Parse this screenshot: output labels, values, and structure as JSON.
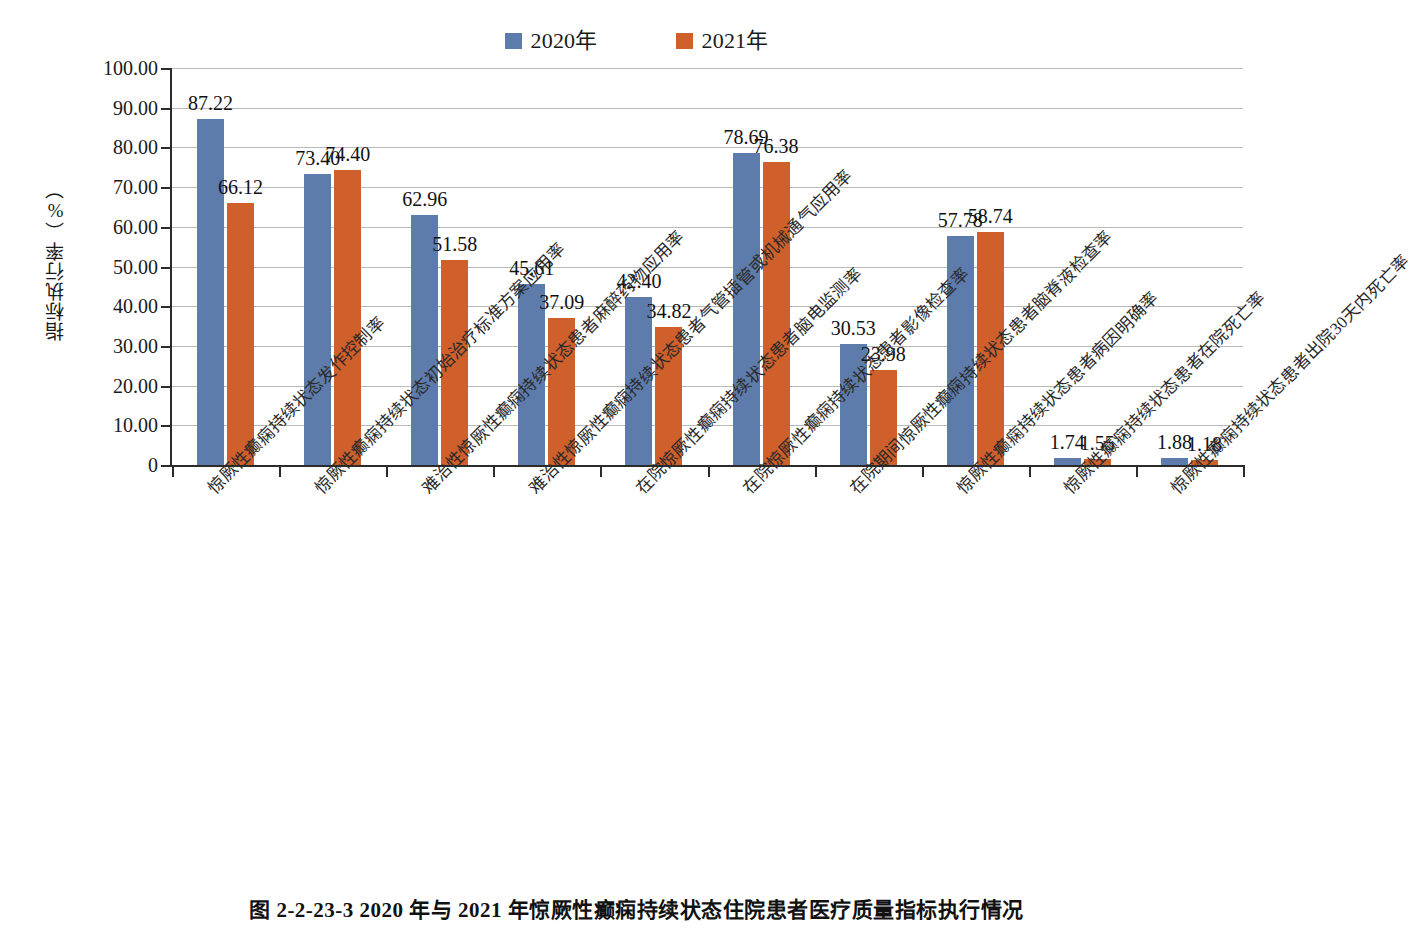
{
  "chart_data": {
    "type": "bar",
    "title": "",
    "xlabel": "",
    "ylabel": "指标执行率（%）",
    "ylim": [
      0,
      100
    ],
    "ytick_labels": [
      "100.00",
      "90.00",
      "80.00",
      "70.00",
      "60.00",
      "50.00",
      "40.00",
      "30.00",
      "20.00",
      "10.00",
      "0"
    ],
    "ytick_values": [
      100,
      90,
      80,
      70,
      60,
      50,
      40,
      30,
      20,
      10,
      0
    ],
    "grid": true,
    "legend_position": "top-center",
    "categories": [
      "惊厥性癫痫持续状态发作控制率",
      "惊厥性癫痫持续状态初始治疗标准方案应用率",
      "难治性惊厥性癫痫持续状态患者麻醉药物应用率",
      "难治性惊厥性癫痫持续状态患者气管插管或机械通气应用率",
      "在院惊厥性癫痫持续状态患者脑电监测率",
      "在院惊厥性癫痫持续状态患者影像检查率",
      "在院期间惊厥性癫痫持续状态患者脑脊液检查率",
      "惊厥性癫痫持续状态患者病因明确率",
      "惊厥性癫痫持续状态患者在院死亡率",
      "惊厥性癫痫持续状态患者出院30天内死亡率"
    ],
    "series": [
      {
        "name": "2020年",
        "color": "#5e7cab",
        "values": [
          87.22,
          73.4,
          62.96,
          45.61,
          42.4,
          78.69,
          30.53,
          57.78,
          1.74,
          1.88
        ],
        "labels": [
          "87.22",
          "73.40",
          "62.96",
          "45.61",
          "42.40",
          "78.69",
          "30.53",
          "57.78",
          "1.74",
          "1.88"
        ]
      },
      {
        "name": "2021年",
        "color": "#cf5f2b",
        "values": [
          66.12,
          74.4,
          51.58,
          37.09,
          34.82,
          76.38,
          23.98,
          58.74,
          1.55,
          1.18
        ],
        "labels": [
          "66.12",
          "74.40",
          "51.58",
          "37.09",
          "34.82",
          "76.38",
          "23.98",
          "58.74",
          "1.55",
          "1.18"
        ]
      }
    ]
  },
  "caption": {
    "text": "图 2-2-23-3    2020 年与 2021 年惊厥性癫痫持续状态住院患者医疗质量指标执行情况"
  },
  "icons": {
    "legend_swatch_2020": "blue-square-icon",
    "legend_swatch_2021": "orange-square-icon"
  }
}
